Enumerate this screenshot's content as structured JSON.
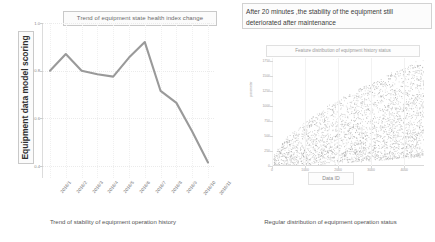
{
  "left_chart": {
    "title": "Trend of equipment state health index change",
    "y_axis_label": "Equipment data model scoring",
    "caption": "Trend of stability of equipment operation history"
  },
  "right_chart": {
    "annotation": "After 20 minutes ,the stability of the equipment still deteriorated after maintenance",
    "title": "Feature distribution of equipment history status",
    "x_axis_label": "Data ID",
    "y_axis_label": "parameter",
    "caption": "Regular distribution of equipment operation status"
  },
  "chart_data": [
    {
      "type": "line",
      "title": "Trend of equipment state health index change",
      "xlabel": "",
      "ylabel": "Equipment data model scoring",
      "categories": [
        "2016/1",
        "2016/2",
        "2016/3",
        "2016/4",
        "2016/5",
        "2016/6",
        "2016/7",
        "2016/8",
        "2016/9",
        "2016/10",
        "2016/11"
      ],
      "values": [
        0.8,
        0.87,
        0.8,
        0.785,
        0.775,
        0.855,
        0.92,
        0.715,
        0.665,
        0.545,
        0.415
      ],
      "ylim": [
        0.35,
        1.0
      ],
      "yticks": [
        1.0,
        0.8,
        0.6,
        0.4,
        0.2
      ],
      "ytick_labels": [
        "1.0",
        "0.8",
        "0.6",
        "0.4",
        "0.2"
      ],
      "line_color": "#9a9a9a",
      "grid": true,
      "legend": "none"
    },
    {
      "type": "scatter",
      "title": "Feature distribution of equipment history status",
      "xlabel": "Data ID",
      "ylabel": "parameter",
      "xlim": [
        0,
        4600
      ],
      "ylim": [
        0,
        1800
      ],
      "xticks": [
        0,
        1000,
        2000,
        3000,
        4000
      ],
      "xtick_labels": [
        "0",
        "1000",
        "2000",
        "3000",
        "4000"
      ],
      "yticks": [
        0,
        250,
        500,
        750,
        1000,
        1250,
        1500,
        1750
      ],
      "ytick_labels": [
        "0",
        "250",
        "500",
        "750",
        "1000",
        "1250",
        "1500",
        "1750"
      ],
      "point_color": "#8f8f8f",
      "grid": true,
      "legend": "none",
      "shape_description": "dense fan-shaped cloud widening from origin toward upper right"
    }
  ]
}
